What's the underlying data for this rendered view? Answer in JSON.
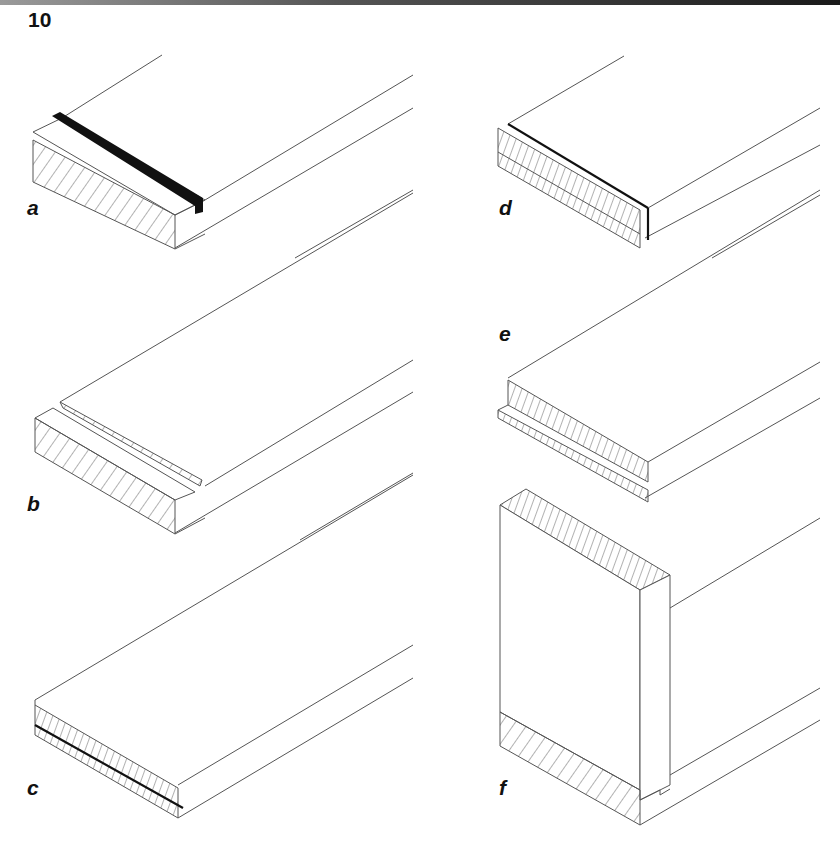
{
  "figure": {
    "number": "10",
    "panels": [
      {
        "id": "a",
        "label": "a",
        "description": "board with groove filled by dark strip (tongue)"
      },
      {
        "id": "b",
        "label": "b",
        "description": "board with groove and rebate, hatched section"
      },
      {
        "id": "c",
        "label": "c",
        "description": "laminated board with glue line on lower layer"
      },
      {
        "id": "d",
        "label": "d",
        "description": "laminated board with edge strip"
      },
      {
        "id": "e",
        "label": "e",
        "description": "board with lipping strip below"
      },
      {
        "id": "f",
        "label": "f",
        "description": "corner joint, vertical panel on horizontal board"
      }
    ]
  },
  "colors": {
    "line": "#555555",
    "ink": "#111111",
    "background": "#ffffff"
  }
}
